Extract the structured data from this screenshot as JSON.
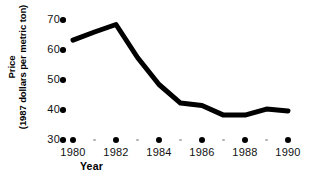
{
  "chart_data": {
    "type": "line",
    "title": "",
    "subtitle": "",
    "xlabel": "Year",
    "ylabel": "Price\n(1987 dollars per metric ton)",
    "ylabel_line1": "Price",
    "ylabel_line2": "(1987 dollars per metric ton)",
    "x": [
      1980,
      1981,
      1982,
      1983,
      1984,
      1985,
      1986,
      1987,
      1988,
      1989,
      1990
    ],
    "values": [
      63.3,
      66.0,
      68.5,
      57.5,
      48.5,
      42.3,
      41.5,
      38.3,
      38.3,
      40.3,
      39.7
    ],
    "series": [
      {
        "name": "Price",
        "values": [
          63.3,
          66.0,
          68.5,
          57.5,
          48.5,
          42.3,
          41.5,
          38.3,
          38.3,
          40.3,
          39.7
        ]
      }
    ],
    "xlim": [
      1980,
      1990
    ],
    "ylim": [
      30,
      70
    ],
    "xticks": [
      1980,
      1982,
      1984,
      1986,
      1988,
      1990
    ],
    "xtick_labels": [
      "1980",
      "1982",
      "1984",
      "1986",
      "1988",
      "1990"
    ],
    "xticks_minor": [
      1981,
      1983,
      1985,
      1987,
      1989
    ],
    "yticks": [
      30,
      40,
      50,
      60,
      70
    ],
    "ytick_labels": [
      "30",
      "40",
      "50",
      "60",
      "70"
    ],
    "grid": false,
    "legend": "none",
    "line_color": "#000000",
    "line_width": 5,
    "marker": "none",
    "tick_major_color": "#000000",
    "tick_minor_color": "#b3b3b3",
    "background_color": "#ffffff"
  },
  "axis": {
    "y_title_line1": "Price",
    "y_title_line2": "(1987 dollars per metric ton)",
    "x_title": "Year"
  }
}
